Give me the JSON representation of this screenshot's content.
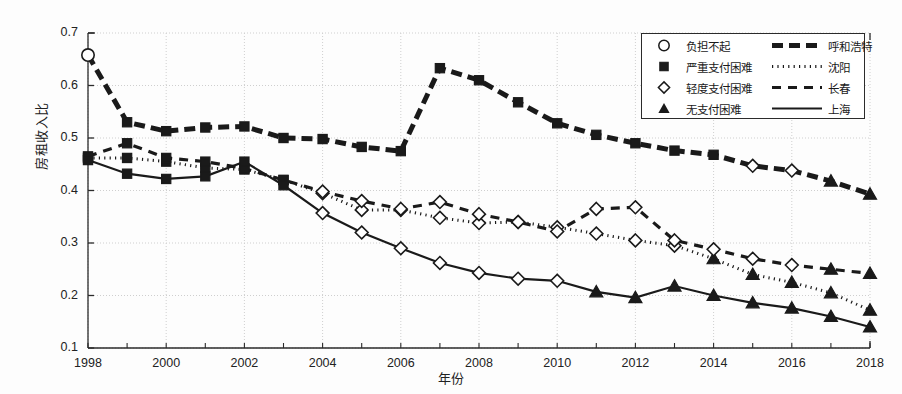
{
  "chart_data": {
    "type": "line",
    "title": "",
    "xlabel": "年份",
    "ylabel": "房租收入比",
    "xlim": [
      1998,
      2018
    ],
    "ylim": [
      0.1,
      0.7
    ],
    "yticks": [
      "0.1",
      "0.2",
      "0.3",
      "0.4",
      "0.5",
      "0.6",
      "0.7"
    ],
    "xticks": [
      "1998",
      "2000",
      "2002",
      "2004",
      "2006",
      "2008",
      "2010",
      "2012",
      "2014",
      "2016",
      "2018"
    ],
    "x": [
      1998,
      1999,
      2000,
      2001,
      2002,
      2003,
      2004,
      2005,
      2006,
      2007,
      2008,
      2009,
      2010,
      2011,
      2012,
      2013,
      2014,
      2015,
      2016,
      2017,
      2018
    ],
    "grid": true,
    "legend_position": "top-right",
    "series": [
      {
        "name": "呼和浩特",
        "style": "thick-dashed",
        "values": [
          0.658,
          0.53,
          0.513,
          0.52,
          0.522,
          0.5,
          0.498,
          0.483,
          0.475,
          0.633,
          0.61,
          0.568,
          0.528,
          0.506,
          0.49,
          0.476,
          0.468,
          0.447,
          0.438,
          0.418,
          0.393
        ],
        "markers": [
          "circle",
          "square",
          "square",
          "square",
          "square",
          "square",
          "square",
          "square",
          "square",
          "square",
          "square",
          "square",
          "square",
          "square",
          "square",
          "square",
          "square",
          "diamond",
          "diamond",
          "triangle",
          "triangle"
        ]
      },
      {
        "name": "沈阳",
        "style": "dotted",
        "values": [
          0.462,
          0.462,
          0.455,
          0.443,
          0.44,
          0.42,
          0.395,
          0.363,
          0.363,
          0.348,
          0.338,
          0.34,
          0.33,
          0.318,
          0.305,
          0.295,
          0.27,
          0.24,
          0.225,
          0.205,
          0.172
        ],
        "markers": [
          "square",
          "square",
          "square",
          "square",
          "square",
          "square",
          "diamond",
          "diamond",
          "diamond",
          "diamond",
          "diamond",
          "diamond",
          "diamond",
          "diamond",
          "diamond",
          "diamond",
          "triangle",
          "triangle",
          "triangle",
          "triangle",
          "triangle"
        ]
      },
      {
        "name": "长春",
        "style": "dashed",
        "values": [
          0.465,
          0.49,
          0.462,
          0.455,
          0.442,
          0.42,
          0.398,
          0.38,
          0.365,
          0.378,
          0.355,
          0.34,
          0.322,
          0.365,
          0.368,
          0.305,
          0.288,
          0.27,
          0.258,
          0.25,
          0.242
        ],
        "markers": [
          "square",
          "square",
          "square",
          "square",
          "square",
          "square",
          "diamond",
          "diamond",
          "diamond",
          "diamond",
          "diamond",
          "diamond",
          "diamond",
          "diamond",
          "diamond",
          "diamond",
          "diamond",
          "diamond",
          "diamond",
          "triangle",
          "triangle"
        ]
      },
      {
        "name": "上海",
        "style": "solid",
        "values": [
          0.458,
          0.432,
          0.422,
          0.427,
          0.455,
          0.41,
          0.357,
          0.32,
          0.29,
          0.262,
          0.243,
          0.232,
          0.228,
          0.207,
          0.196,
          0.218,
          0.2,
          0.186,
          0.176,
          0.16,
          0.14
        ],
        "markers": [
          "square",
          "square",
          "square",
          "square",
          "square",
          "square",
          "diamond",
          "diamond",
          "diamond",
          "diamond",
          "diamond",
          "diamond",
          "diamond",
          "triangle",
          "triangle",
          "triangle",
          "triangle",
          "triangle",
          "triangle",
          "triangle",
          "triangle"
        ]
      }
    ],
    "marker_legend": [
      {
        "symbol": "circle",
        "label": "负担不起"
      },
      {
        "symbol": "square",
        "label": "严重支付困难"
      },
      {
        "symbol": "diamond",
        "label": "轻度支付困难"
      },
      {
        "symbol": "triangle",
        "label": "无支付困难"
      }
    ],
    "line_legend": [
      {
        "style": "thick-dashed",
        "label": "呼和浩特"
      },
      {
        "style": "dotted",
        "label": "沈阳"
      },
      {
        "style": "dashed",
        "label": "长春"
      },
      {
        "style": "solid",
        "label": "上海"
      }
    ],
    "colors": {
      "ink": "#1a1a1a",
      "grid": "#cfcfcf",
      "frame": "#2b2b2b"
    }
  }
}
